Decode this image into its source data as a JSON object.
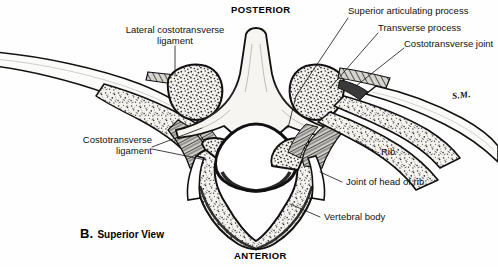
{
  "figure": {
    "panel_letter": "B.",
    "panel_caption": "Superior View",
    "artist_signature": "S.M.",
    "orientation": {
      "top": "POSTERIOR",
      "bottom": "ANTERIOR"
    },
    "colors": {
      "ink": "#111111",
      "background": "#ffffff",
      "bone_fill": "#f2f1ee",
      "cortical_fill": "#fbfbf9",
      "stipple": "#2b2b2b"
    }
  },
  "labels": [
    {
      "id": "lateral-costotransverse-ligament",
      "line1": "Lateral costotransverse",
      "line2": "ligament"
    },
    {
      "id": "superior-articulating-process",
      "line1": "Superior articulating process",
      "line2": ""
    },
    {
      "id": "transverse-process",
      "line1": "Transverse process",
      "line2": ""
    },
    {
      "id": "costotransverse-joint",
      "line1": "Costotransverse joint",
      "line2": ""
    },
    {
      "id": "costotransverse-ligament",
      "line1": "Costotransverse",
      "line2": "ligament"
    },
    {
      "id": "rib",
      "line1": "Rib",
      "line2": ""
    },
    {
      "id": "joint-of-head-of-rib",
      "line1": "Joint of head of rib",
      "line2": ""
    },
    {
      "id": "vertebral-body",
      "line1": "Vertebral body",
      "line2": ""
    }
  ]
}
